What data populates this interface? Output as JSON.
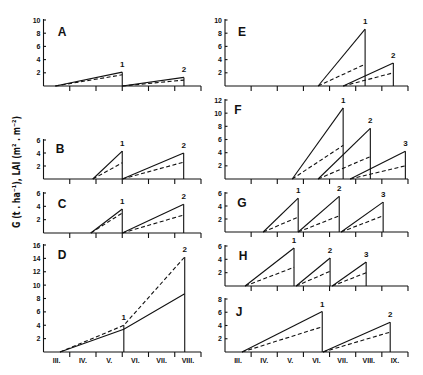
{
  "figure": {
    "y_axis_title": "G (t . ha⁻¹), LAI (m² . m⁻²)"
  },
  "chart_data": {
    "type": "line",
    "title": "",
    "xlabel": "",
    "ylabel": "G (t . ha⁻¹), LAI (m² . m⁻²)",
    "grid": false,
    "legend": null,
    "line_styles": [
      "solid",
      "dashed"
    ],
    "x_axes": {
      "left": {
        "xlim": [
          3,
          9
        ],
        "tick_labels": [
          "III.",
          "IV.",
          "V.",
          "VI.",
          "VII.",
          "VIII."
        ]
      },
      "right": {
        "xlim": [
          3,
          10
        ],
        "tick_labels": [
          "III.",
          "IV.",
          "V.",
          "VI.",
          "VII.",
          "VIII.",
          "IX."
        ]
      }
    },
    "panels": [
      {
        "id": "A",
        "column": "left",
        "ylim": [
          0,
          10
        ],
        "yticks": [
          2,
          4,
          6,
          8,
          10
        ],
        "segments": [
          {
            "x": [
              3.45,
              6.0
            ],
            "solid": [
              0,
              2.1
            ],
            "dashed": [
              0,
              1.7
            ],
            "cuts": [
              {
                "index": 1,
                "label": "1"
              }
            ]
          },
          {
            "x": [
              6.0,
              8.35
            ],
            "solid": [
              0,
              1.3
            ],
            "dashed": [
              0,
              0.9
            ],
            "cuts": [
              {
                "index": 1,
                "label": "2"
              }
            ]
          }
        ]
      },
      {
        "id": "B",
        "column": "left",
        "ylim": [
          0,
          6
        ],
        "yticks": [
          2,
          4,
          6
        ],
        "segments": [
          {
            "x": [
              4.88,
              6.0
            ],
            "solid": [
              0,
              4.3
            ],
            "dashed": [
              0,
              2.5
            ],
            "cuts": [
              {
                "index": 1,
                "label": "1"
              }
            ]
          },
          {
            "x": [
              6.0,
              8.34
            ],
            "solid": [
              0,
              4.0
            ],
            "dashed": [
              0,
              2.6
            ],
            "cuts": [
              {
                "index": 1,
                "label": "2"
              }
            ]
          }
        ]
      },
      {
        "id": "C",
        "column": "left",
        "ylim": [
          0,
          6
        ],
        "yticks": [
          2,
          4,
          6
        ],
        "segments": [
          {
            "x": [
              4.8,
              6.0
            ],
            "solid": [
              0,
              3.6
            ],
            "dashed": [
              0,
              3.0
            ],
            "cuts": [
              {
                "index": 1,
                "label": "1"
              }
            ]
          },
          {
            "x": [
              6.0,
              8.34
            ],
            "solid": [
              0,
              4.3
            ],
            "dashed": [
              0,
              2.7
            ],
            "cuts": [
              {
                "index": 1,
                "label": "2"
              }
            ]
          }
        ]
      },
      {
        "id": "D",
        "column": "left",
        "ylim": [
          0,
          16
        ],
        "yticks": [
          2,
          4,
          6,
          8,
          10,
          12,
          14,
          16
        ],
        "show_month_labels": true,
        "segments": [
          {
            "x": [
              3.63,
              6.06,
              8.38
            ],
            "solid": [
              0,
              3.4,
              8.7
            ],
            "dashed": [
              0,
              4.0,
              14.2
            ],
            "cuts": [
              {
                "index": 1,
                "label": "1"
              },
              {
                "index": 2,
                "label": "2"
              }
            ]
          }
        ]
      },
      {
        "id": "E",
        "column": "right",
        "ylim": [
          0,
          10
        ],
        "yticks": [
          2,
          4,
          6,
          8,
          10
        ],
        "segments": [
          {
            "x": [
              6.56,
              8.36
            ],
            "solid": [
              0,
              8.6
            ],
            "dashed": [
              0,
              3.3
            ],
            "cuts": [
              {
                "index": 1,
                "label": "1"
              }
            ]
          },
          {
            "x": [
              7.52,
              9.44
            ],
            "solid": [
              0,
              3.5
            ],
            "dashed": [
              0,
              2.0
            ],
            "cuts": [
              {
                "index": 1,
                "label": "2"
              }
            ]
          }
        ]
      },
      {
        "id": "F",
        "column": "right",
        "ylim": [
          0,
          12
        ],
        "yticks": [
          2,
          4,
          6,
          8,
          10,
          12
        ],
        "segments": [
          {
            "x": [
              5.57,
              7.52
            ],
            "solid": [
              0,
              10.8
            ],
            "dashed": [
              0,
              5.1
            ],
            "cuts": [
              {
                "index": 1,
                "label": "1"
              }
            ]
          },
          {
            "x": [
              6.56,
              8.56
            ],
            "solid": [
              0,
              7.7
            ],
            "dashed": [
              0,
              3.4
            ],
            "cuts": [
              {
                "index": 1,
                "label": "2"
              }
            ]
          },
          {
            "x": [
              7.79,
              9.9
            ],
            "solid": [
              0,
              4.2
            ],
            "dashed": [
              0,
              2.0
            ],
            "cuts": [
              {
                "index": 1,
                "label": "3"
              }
            ]
          }
        ]
      },
      {
        "id": "G",
        "column": "right",
        "ylim": [
          0,
          6
        ],
        "yticks": [
          2,
          4,
          6
        ],
        "segments": [
          {
            "x": [
              4.46,
              5.8
            ],
            "solid": [
              0,
              5.2
            ],
            "dashed": [
              0,
              2.3
            ],
            "cuts": [
              {
                "index": 1,
                "label": "1"
              }
            ]
          },
          {
            "x": [
              5.8,
              7.37
            ],
            "solid": [
              0,
              5.5
            ],
            "dashed": [
              0,
              2.5
            ],
            "cuts": [
              {
                "index": 1,
                "label": "2"
              }
            ]
          },
          {
            "x": [
              7.44,
              9.05
            ],
            "solid": [
              0,
              4.6
            ],
            "dashed": [
              0,
              2.5
            ],
            "cuts": [
              {
                "index": 1,
                "label": "3"
              }
            ]
          }
        ]
      },
      {
        "id": "H",
        "column": "right",
        "ylim": [
          0,
          6
        ],
        "yticks": [
          2,
          4,
          6
        ],
        "segments": [
          {
            "x": [
              3.77,
              5.64
            ],
            "solid": [
              0,
              5.7
            ],
            "dashed": [
              0,
              2.8
            ],
            "cuts": [
              {
                "index": 1,
                "label": "1"
              }
            ]
          },
          {
            "x": [
              5.72,
              7.02
            ],
            "solid": [
              0,
              4.2
            ],
            "dashed": [
              0,
              2.2
            ],
            "cuts": [
              {
                "index": 1,
                "label": "2"
              }
            ]
          },
          {
            "x": [
              7.1,
              8.4
            ],
            "solid": [
              0,
              3.6
            ],
            "dashed": [
              0,
              2.0
            ],
            "cuts": [
              {
                "index": 1,
                "label": "3"
              }
            ]
          }
        ]
      },
      {
        "id": "J",
        "column": "right",
        "ylim": [
          0,
          8
        ],
        "yticks": [
          2,
          4,
          6,
          8
        ],
        "show_month_labels": true,
        "segments": [
          {
            "x": [
              3.65,
              6.72
            ],
            "solid": [
              0,
              6.1
            ],
            "dashed": [
              0,
              3.8
            ],
            "cuts": [
              {
                "index": 1,
                "label": "1"
              }
            ]
          },
          {
            "x": [
              6.75,
              9.32
            ],
            "solid": [
              0,
              4.5
            ],
            "dashed": [
              0,
              3.0
            ],
            "cuts": [
              {
                "index": 1,
                "label": "2"
              }
            ]
          }
        ]
      }
    ]
  }
}
